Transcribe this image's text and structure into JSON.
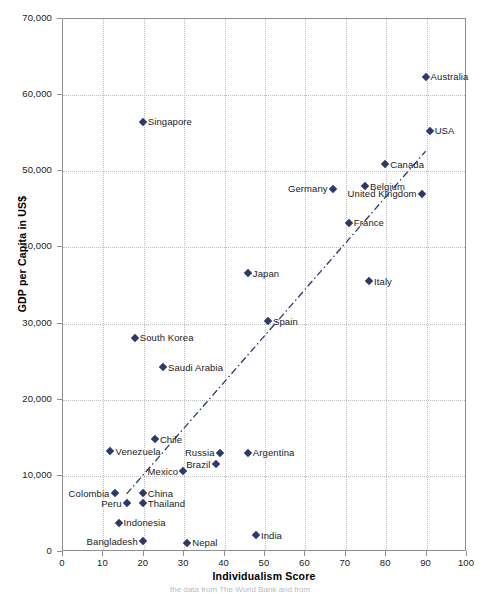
{
  "chart_data": {
    "type": "scatter",
    "title": "",
    "xlabel": "Individualism Score",
    "ylabel": "GDP per Capita in US$",
    "xlim": [
      0,
      100
    ],
    "ylim": [
      0,
      70000
    ],
    "xticks": [
      "0",
      "10",
      "20",
      "30",
      "40",
      "50",
      "60",
      "70",
      "80",
      "90",
      "100"
    ],
    "yticks": [
      "0",
      "10,000",
      "20,000",
      "30,000",
      "40,000",
      "50,000",
      "60,000",
      "70,000"
    ],
    "grid": "both-dotted",
    "legend": "none",
    "marker_color": "#2b3a67",
    "marker_shape": "diamond",
    "trendline": {
      "style": "dash-dot",
      "color": "#2b3a67",
      "x_start": 16,
      "y_start": 7500,
      "x_end": 90,
      "y_end": 52500
    },
    "points": [
      {
        "label": "Australia",
        "x": 90,
        "y": 62300,
        "label_side": "right"
      },
      {
        "label": "USA",
        "x": 91,
        "y": 55200,
        "label_side": "right"
      },
      {
        "label": "Canada",
        "x": 80,
        "y": 50800,
        "label_side": "right"
      },
      {
        "label": "United Kingdom",
        "x": 89,
        "y": 46900,
        "label_side": "left"
      },
      {
        "label": "Belgium",
        "x": 75,
        "y": 47900,
        "label_side": "right"
      },
      {
        "label": "Germany",
        "x": 67,
        "y": 47600,
        "label_side": "left"
      },
      {
        "label": "France",
        "x": 71,
        "y": 43100,
        "label_side": "right"
      },
      {
        "label": "Japan",
        "x": 46,
        "y": 36500,
        "label_side": "right"
      },
      {
        "label": "Italy",
        "x": 76,
        "y": 35400,
        "label_side": "right"
      },
      {
        "label": "Spain",
        "x": 51,
        "y": 30200,
        "label_side": "right"
      },
      {
        "label": "Singapore",
        "x": 20,
        "y": 56400,
        "label_side": "right"
      },
      {
        "label": "South Korea",
        "x": 18,
        "y": 28000,
        "label_side": "right"
      },
      {
        "label": "Saudi Arabia",
        "x": 25,
        "y": 24100,
        "label_side": "right"
      },
      {
        "label": "Chile",
        "x": 23,
        "y": 14700,
        "label_side": "right"
      },
      {
        "label": "Venezuela",
        "x": 12,
        "y": 13100,
        "label_side": "right"
      },
      {
        "label": "Russia",
        "x": 39,
        "y": 12900,
        "label_side": "left"
      },
      {
        "label": "Argentina",
        "x": 46,
        "y": 12900,
        "label_side": "right"
      },
      {
        "label": "Brazil",
        "x": 38,
        "y": 11400,
        "label_side": "left"
      },
      {
        "label": "Mexico",
        "x": 30,
        "y": 10500,
        "label_side": "left"
      },
      {
        "label": "Colombia",
        "x": 13,
        "y": 7600,
        "label_side": "left"
      },
      {
        "label": "Peru",
        "x": 16,
        "y": 6300,
        "label_side": "left"
      },
      {
        "label": "China",
        "x": 20,
        "y": 7600,
        "label_side": "right"
      },
      {
        "label": "Thailand",
        "x": 20,
        "y": 6300,
        "label_side": "right"
      },
      {
        "label": "Indonesia",
        "x": 14,
        "y": 3700,
        "label_side": "right"
      },
      {
        "label": "Bangladesh",
        "x": 20,
        "y": 1300,
        "label_side": "left"
      },
      {
        "label": "Nepal",
        "x": 31,
        "y": 1100,
        "label_side": "right"
      },
      {
        "label": "India",
        "x": 48,
        "y": 2100,
        "label_side": "right"
      }
    ]
  },
  "source_caption": "the data from The World Bank and from"
}
